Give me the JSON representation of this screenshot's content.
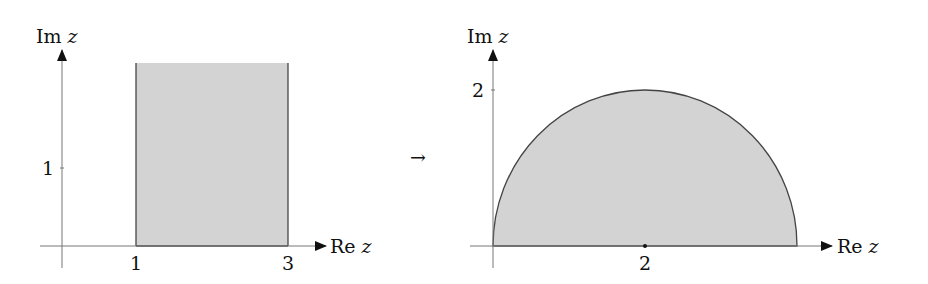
{
  "left_plot": {
    "y_axis_label": "Im",
    "y_axis_var": "z",
    "x_axis_label": "Re",
    "x_axis_var": "z",
    "y_tick": "1",
    "x_ticks": [
      "1",
      "3"
    ],
    "region": "vertical strip 1 ≤ Re z ≤ 3, Im z ≥ 0"
  },
  "mapping_arrow": "→",
  "right_plot": {
    "y_axis_label": "Im",
    "y_axis_var": "z",
    "x_axis_label": "Re",
    "x_axis_var": "z",
    "y_tick": "2",
    "x_tick": "2",
    "region": "upper half-disk centered at 2 with radius 2"
  },
  "colors": {
    "fill": "#d3d3d3",
    "stroke": "#444444",
    "axis": "#777777"
  }
}
